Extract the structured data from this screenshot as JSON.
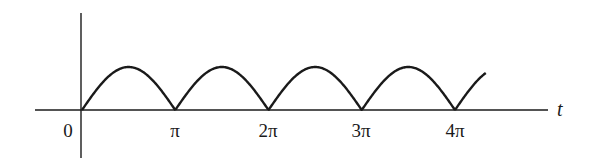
{
  "chart_data": {
    "type": "line",
    "title": "",
    "function": "|sin t|",
    "xlabel": "t",
    "ylabel": "",
    "x_tick_labels": [
      "0",
      "π",
      "2π",
      "3π",
      "4π"
    ],
    "x_tick_values": [
      0,
      3.14159,
      6.28319,
      9.42478,
      12.56637
    ],
    "xlim": [
      -0.5,
      4.95
    ],
    "ylim": [
      -1,
      2.2
    ],
    "grid": false,
    "legend": null,
    "series": [
      {
        "name": "|sin t|",
        "x": [
          0,
          0.785,
          1.571,
          2.356,
          3.142,
          3.927,
          4.712,
          5.498,
          6.283,
          7.069,
          7.854,
          8.639,
          9.425,
          10.21,
          10.996,
          11.781,
          12.566,
          13.6
        ],
        "values": [
          0,
          0.707,
          1,
          0.707,
          0,
          0.707,
          1,
          0.707,
          0,
          0.707,
          1,
          0.707,
          0,
          0.707,
          1,
          0.707,
          0,
          0.86
        ]
      }
    ],
    "t_end_in_pi": 4.33
  },
  "labels": {
    "origin": "0",
    "pi1": "π",
    "pi2": "2π",
    "pi3": "3π",
    "pi4": "4π",
    "axis_t": "t"
  }
}
